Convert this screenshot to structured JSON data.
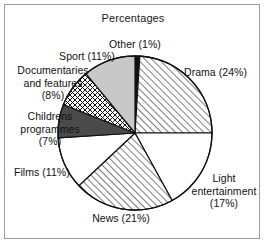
{
  "chart_data": {
    "type": "pie",
    "title": "Percentages",
    "xlabel": "",
    "ylabel": "",
    "legend_position": "none",
    "grid": false,
    "categories": [
      "Other",
      "Drama",
      "Light entertainment",
      "News",
      "Films",
      "Childrens programmes",
      "Documentaries and features",
      "Sport"
    ],
    "values": [
      1,
      24,
      17,
      21,
      11,
      7,
      8,
      11
    ],
    "units": "%",
    "start_angle_deg": 0,
    "direction": "clockwise",
    "slices": [
      {
        "name": "Other",
        "value": 1,
        "label": "Other (1%)",
        "fill": "solid-black",
        "color": "#111111"
      },
      {
        "name": "Drama",
        "value": 24,
        "label": "Drama (24%)",
        "fill": "diagonal-hatch",
        "color": "#ffffff"
      },
      {
        "name": "Light entertainment",
        "value": 17,
        "label_lines": [
          "Light",
          "entertainment",
          "(17%)"
        ],
        "label": "Light entertainment (17%)",
        "fill": "none",
        "color": "#ffffff"
      },
      {
        "name": "News",
        "value": 21,
        "label": "News (21%)",
        "fill": "diagonal-hatch",
        "color": "#ffffff"
      },
      {
        "name": "Films",
        "value": 11,
        "label": "Films (11%)",
        "fill": "none",
        "color": "#ffffff"
      },
      {
        "name": "Childrens programmes",
        "value": 7,
        "label_lines": [
          "Childrens",
          "programmes",
          "(7%)"
        ],
        "label": "Childrens programmes (7%)",
        "fill": "solid-dark-gray",
        "color": "#4a4a4a"
      },
      {
        "name": "Documentaries and features",
        "value": 8,
        "label_lines": [
          "Documentaries",
          "and features",
          "(8%)"
        ],
        "label": "Documentaries and features (8%)",
        "fill": "crosshatch",
        "color": "#ffffff"
      },
      {
        "name": "Sport",
        "value": 11,
        "label": "Sport (11%)",
        "fill": "solid-light-gray",
        "color": "#c8c8c8"
      }
    ]
  },
  "labels": {
    "title": "Percentages",
    "other": "Other (1%)",
    "sport": "Sport (11%)",
    "drama": "Drama (24%)",
    "documentaries_l1": "Documentaries",
    "documentaries_l2": "and features",
    "documentaries_l3": "(8%)",
    "childrens_l1": "Childrens",
    "childrens_l2": "programmes",
    "childrens_l3": "(7%)",
    "films": "Films (11%)",
    "news": "News (21%)",
    "light_l1": "Light",
    "light_l2": "entertainment",
    "light_l3": "(17%)"
  },
  "colors": {
    "outline": "#111111",
    "frame": "#9a9a9a",
    "background": "#ffffff",
    "slice_black": "#111111",
    "slice_dark_gray": "#4a4a4a",
    "slice_light_gray": "#c8c8c8",
    "text": "#111111"
  }
}
